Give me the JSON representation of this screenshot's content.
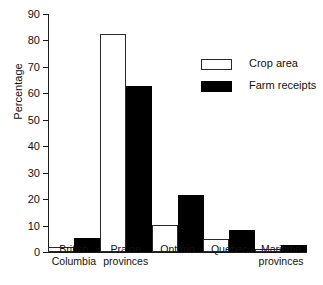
{
  "chart_data": {
    "type": "bar",
    "title": "",
    "xlabel": "",
    "ylabel": "Percentage",
    "ylim": [
      0,
      90
    ],
    "yticks": [
      0,
      10,
      20,
      30,
      40,
      50,
      60,
      70,
      80,
      90
    ],
    "grid": false,
    "legend_position": "upper right",
    "categories": [
      "British Columbia",
      "Prairie provinces",
      "Ontario",
      "Quebec",
      "Maritime provinces"
    ],
    "category_lines": [
      [
        "British",
        "Columbia"
      ],
      [
        "Prairie",
        "provinces"
      ],
      [
        "Ontario",
        ""
      ],
      [
        "Quebec",
        ""
      ],
      [
        "Maritime",
        "provinces"
      ]
    ],
    "series": [
      {
        "name": "Crop area",
        "color": "#ffffff",
        "edge_color": "#2a2a2a",
        "values": [
          2.0,
          82.3,
          10.2,
          5.0,
          1.2
        ]
      },
      {
        "name": "Farm receipts",
        "color": "#000000",
        "edge_color": "#000000",
        "values": [
          5.3,
          62.7,
          21.5,
          8.2,
          2.5
        ]
      }
    ]
  },
  "axis": {
    "y_label": "Percentage",
    "y_tick_labels": [
      "0",
      "10",
      "20",
      "30",
      "40",
      "50",
      "60",
      "70",
      "80",
      "90"
    ]
  },
  "legend": {
    "entries": [
      {
        "label": "Crop area",
        "swatch": "open-rectangle-swatch"
      },
      {
        "label": "Farm receipts",
        "swatch": "filled-rectangle-swatch"
      }
    ]
  }
}
